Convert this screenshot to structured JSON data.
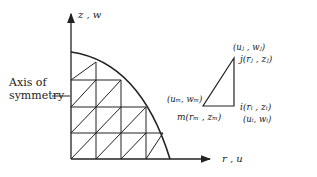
{
  "axes": {
    "vertical_label": "z , w",
    "horizontal_label": "r , u"
  },
  "annotation": {
    "line1": "Axis of",
    "line2": "symmetry"
  },
  "mesh": {
    "columns": 4,
    "rows": 4,
    "description": "Quarter-circle cross-section discretized into triangular ring elements"
  },
  "element": {
    "node_j_disp": "(uⱼ , wⱼ)",
    "node_j": "j(rⱼ , zⱼ)",
    "node_m_disp": "(uₘ, wₘ)",
    "node_m": "m(rₘ , zₘ)",
    "node_i": "i(rᵢ , zᵢ)",
    "node_i_disp": "(uᵢ, wᵢ)"
  }
}
